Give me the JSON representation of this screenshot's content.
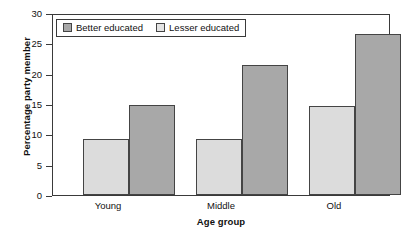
{
  "chart_data": {
    "type": "bar",
    "title": "",
    "subtitle": "",
    "xlabel": "Age group",
    "ylabel": "Percentage party member",
    "categories": [
      "Young",
      "Middle",
      "Old"
    ],
    "series": [
      {
        "name": "Lesser educated",
        "values": [
          9.4,
          9.4,
          14.9
        ],
        "color": "#dcdcdc"
      },
      {
        "name": "Better educated",
        "values": [
          15.0,
          21.7,
          26.8
        ],
        "color": "#a8a8a8"
      }
    ],
    "bar_order_in_group": [
      "Lesser educated",
      "Better educated"
    ],
    "legend_order": [
      "Better educated",
      "Lesser educated"
    ],
    "legend_position": "inside top-left",
    "ylim": [
      0,
      30
    ],
    "ytick_values": [
      "0",
      "5",
      "10",
      "15",
      "20",
      "25",
      "30"
    ],
    "grid": false,
    "frame": true
  },
  "legend": {
    "entries": [
      {
        "label": "Better educated",
        "swatch": "dark-gray-swatch"
      },
      {
        "label": "Lesser educated",
        "swatch": "light-gray-swatch"
      }
    ]
  },
  "axes": {
    "y_title": "Percentage party member",
    "x_title": "Age group",
    "y_ticks": [
      "30",
      "25",
      "20",
      "15",
      "10",
      "5",
      "0"
    ],
    "x_ticks": [
      "Young",
      "Middle",
      "Old"
    ]
  }
}
